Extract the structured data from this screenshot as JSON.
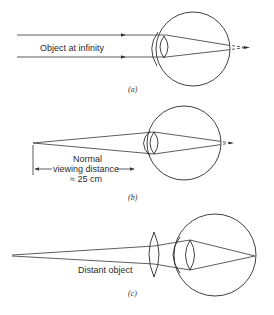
{
  "figure": {
    "panels": [
      {
        "id": "a",
        "caption": "(a)",
        "label": "Object at infinity"
      },
      {
        "id": "b",
        "caption": "(b)",
        "label_lines": [
          "Normal",
          "viewing distance",
          "≈ 25 cm"
        ]
      },
      {
        "id": "c",
        "caption": "(c)",
        "label": "Distant object"
      }
    ]
  }
}
